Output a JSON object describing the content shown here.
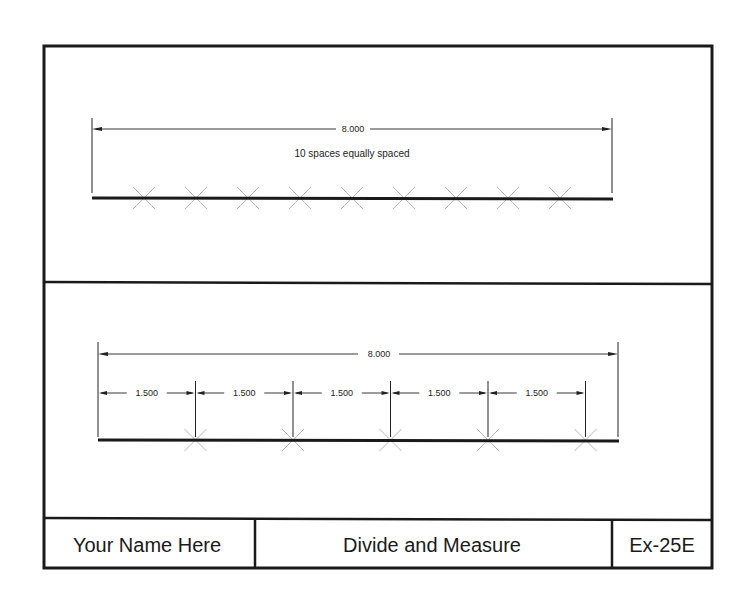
{
  "top_view": {
    "total_dimension": "8.000",
    "note": "10 spaces equally spaced",
    "total_length_units": 8.0,
    "divisions": 10
  },
  "bottom_view": {
    "total_dimension": "8.000",
    "total_length_units": 8.0,
    "segment_length_units": 1.5,
    "segment_labels": [
      "1.500",
      "1.500",
      "1.500",
      "1.500",
      "1.500"
    ]
  },
  "title_block": {
    "name": "Your Name Here",
    "title": "Divide and Measure",
    "exercise": "Ex-25E"
  }
}
